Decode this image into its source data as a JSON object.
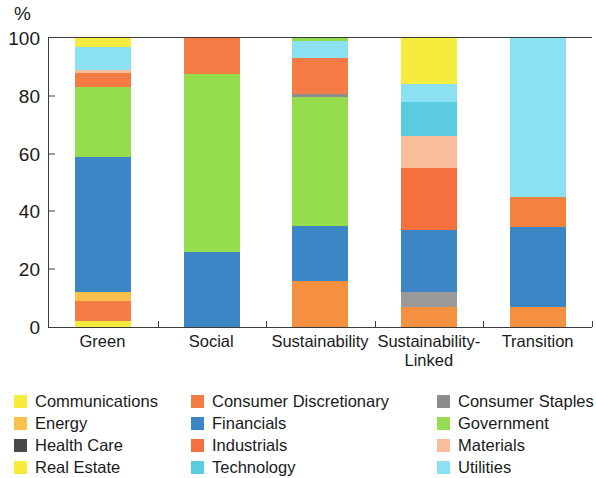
{
  "chart_data": {
    "type": "bar",
    "stacked": true,
    "stack_mode": "percent",
    "title": "",
    "subtitle": "",
    "xlabel": "",
    "ylabel": "%",
    "ylim": [
      0,
      100
    ],
    "yticks": [
      0,
      20,
      40,
      60,
      80,
      100
    ],
    "ytick_labels": [
      "0",
      "20",
      "40",
      "60",
      "80",
      "100"
    ],
    "grid": false,
    "legend_position": "bottom",
    "legend_columns": 3,
    "categories": [
      "Green",
      "Social",
      "Sustainability",
      "Sustainability-\nLinked",
      "Transition"
    ],
    "category_labels": [
      [
        "Green"
      ],
      [
        "Social"
      ],
      [
        "Sustainability"
      ],
      [
        "Sustainability-",
        "Linked"
      ],
      [
        "Transition"
      ]
    ],
    "series": [
      {
        "name": "Communications",
        "color": "#f5ec3d",
        "values": [
          3.0,
          0.0,
          0.0,
          6.0,
          0.0
        ]
      },
      {
        "name": "Consumer Discretionary",
        "color": "#f47b43",
        "values": [
          5.0,
          12.5,
          12.5,
          7.0,
          10.5
        ]
      },
      {
        "name": "Consumer Staples",
        "color": "#8c8c8c",
        "values": [
          0.0,
          0.0,
          1.0,
          5.0,
          0.0
        ]
      },
      {
        "name": "Energy",
        "color": "#fbbf4c",
        "values": [
          3.0,
          0.0,
          0.0,
          0.0,
          0.0
        ]
      },
      {
        "name": "Financials",
        "color": "#3d86c6",
        "values": [
          47.0,
          26.0,
          19.0,
          21.5,
          27.5
        ]
      },
      {
        "name": "Government",
        "color": "#96dc4f",
        "values": [
          24.0,
          61.5,
          44.5,
          0.0,
          0.0
        ]
      },
      {
        "name": "Health Care",
        "color": "#4a4a4a",
        "values": [
          0.0,
          0.0,
          0.0,
          0.0,
          0.0
        ]
      },
      {
        "name": "Industrials",
        "color": "#f4703f",
        "values": [
          0.0,
          0.0,
          0.0,
          21.5,
          0.0
        ]
      },
      {
        "name": "Materials",
        "color": "#f9bd9b",
        "values": [
          1.0,
          0.0,
          0.0,
          11.0,
          0.0
        ]
      },
      {
        "name": "Real Estate",
        "color": "#f5ec3d",
        "values": [
          2.0,
          0.0,
          0.0,
          0.0,
          0.0
        ]
      },
      {
        "name": "Technology",
        "color": "#5bcbe0",
        "values": [
          0.0,
          0.0,
          0.0,
          12.0,
          0.0
        ]
      },
      {
        "name": "Utilities",
        "color": "#8be0f2",
        "values": [
          8.0,
          0.0,
          6.0,
          6.0,
          55.0
        ]
      }
    ],
    "stacks": [
      {
        "category": "Green",
        "segments": [
          {
            "name": "Real Estate",
            "color": "#f5ec3d",
            "from": 0,
            "to": 2,
            "value": 2.0
          },
          {
            "name": "Consumer Discretionary",
            "color": "#f47b43",
            "from": 2,
            "to": 9,
            "value": 7.0
          },
          {
            "name": "Energy",
            "color": "#fbbf4c",
            "from": 9,
            "to": 12,
            "value": 3.0
          },
          {
            "name": "Financials",
            "color": "#3d86c6",
            "from": 12,
            "to": 59,
            "value": 47.0
          },
          {
            "name": "Government",
            "color": "#96dc4f",
            "from": 59,
            "to": 83,
            "value": 24.0
          },
          {
            "name": "Consumer Discretionary",
            "color": "#f47b43",
            "from": 83,
            "to": 88,
            "value": 5.0
          },
          {
            "name": "Materials",
            "color": "#f9bd9b",
            "from": 88,
            "to": 89,
            "value": 1.0
          },
          {
            "name": "Utilities",
            "color": "#8be0f2",
            "from": 89,
            "to": 97,
            "value": 8.0
          },
          {
            "name": "Communications",
            "color": "#f5ec3d",
            "from": 97,
            "to": 100,
            "value": 3.0
          }
        ]
      },
      {
        "category": "Social",
        "segments": [
          {
            "name": "Financials",
            "color": "#3d86c6",
            "from": 0,
            "to": 26,
            "value": 26.0
          },
          {
            "name": "Government",
            "color": "#96dc4f",
            "from": 26,
            "to": 87.5,
            "value": 61.5
          },
          {
            "name": "Consumer Discretionary",
            "color": "#f47b43",
            "from": 87.5,
            "to": 100,
            "value": 12.5
          }
        ]
      },
      {
        "category": "Sustainability",
        "segments": [
          {
            "name": "Consumer Discretionary",
            "color": "#f4903f",
            "from": 0,
            "to": 16,
            "value": 16.0
          },
          {
            "name": "Financials",
            "color": "#3d86c6",
            "from": 16,
            "to": 35,
            "value": 19.0
          },
          {
            "name": "Government",
            "color": "#96dc4f",
            "from": 35,
            "to": 79.5,
            "value": 44.5
          },
          {
            "name": "Consumer Staples",
            "color": "#8c8c8c",
            "from": 79.5,
            "to": 80.5,
            "value": 1.0
          },
          {
            "name": "Consumer Discretionary",
            "color": "#f47b43",
            "from": 80.5,
            "to": 93,
            "value": 12.5
          },
          {
            "name": "Utilities",
            "color": "#8be0f2",
            "from": 93,
            "to": 99,
            "value": 6.0
          },
          {
            "name": "Government",
            "color": "#96dc4f",
            "from": 99,
            "to": 100,
            "value": 1.0
          }
        ]
      },
      {
        "category": "Sustainability-Linked",
        "segments": [
          {
            "name": "Consumer Discretionary",
            "color": "#f4903f",
            "from": 0,
            "to": 7,
            "value": 7.0
          },
          {
            "name": "Consumer Staples",
            "color": "#9a9a9a",
            "from": 7,
            "to": 12,
            "value": 5.0
          },
          {
            "name": "Financials",
            "color": "#3d86c6",
            "from": 12,
            "to": 33.5,
            "value": 21.5
          },
          {
            "name": "Industrials",
            "color": "#f4703f",
            "from": 33.5,
            "to": 55,
            "value": 21.5
          },
          {
            "name": "Materials",
            "color": "#f9bd9b",
            "from": 55,
            "to": 66,
            "value": 11.0
          },
          {
            "name": "Technology",
            "color": "#5bcbe0",
            "from": 66,
            "to": 78,
            "value": 12.0
          },
          {
            "name": "Utilities",
            "color": "#8be0f2",
            "from": 78,
            "to": 84,
            "value": 6.0
          },
          {
            "name": "Communications",
            "color": "#f5ec3d",
            "from": 84,
            "to": 100,
            "value": 16.0
          }
        ]
      },
      {
        "category": "Transition",
        "segments": [
          {
            "name": "Consumer Discretionary",
            "color": "#f4903f",
            "from": 0,
            "to": 7,
            "value": 7.0
          },
          {
            "name": "Financials",
            "color": "#3d86c6",
            "from": 7,
            "to": 34.5,
            "value": 27.5
          },
          {
            "name": "Consumer Discretionary",
            "color": "#f4823f",
            "from": 34.5,
            "to": 45,
            "value": 10.5
          },
          {
            "name": "Utilities",
            "color": "#8be0f2",
            "from": 45,
            "to": 100,
            "value": 55.0
          }
        ]
      }
    ],
    "legend": [
      {
        "label": "Communications",
        "color": "#f5ec3d"
      },
      {
        "label": "Consumer Discretionary",
        "color": "#f47b43"
      },
      {
        "label": "Consumer Staples",
        "color": "#8c8c8c"
      },
      {
        "label": "Energy",
        "color": "#fbbf4c"
      },
      {
        "label": "Financials",
        "color": "#3d86c6"
      },
      {
        "label": "Government",
        "color": "#96dc4f"
      },
      {
        "label": "Health Care",
        "color": "#4a4a4a"
      },
      {
        "label": "Industrials",
        "color": "#f4703f"
      },
      {
        "label": "Materials",
        "color": "#f9bd9b"
      },
      {
        "label": "Real Estate",
        "color": "#f5ec3d"
      },
      {
        "label": "Technology",
        "color": "#5bcbe0"
      },
      {
        "label": "Utilities",
        "color": "#8be0f2"
      }
    ],
    "axis_color": "#3b3b3b"
  }
}
